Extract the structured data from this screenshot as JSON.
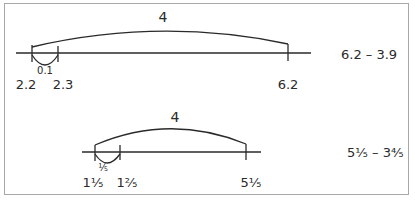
{
  "diagram_1": {
    "jump_label": "4",
    "small_jump_label": "0.1",
    "tick_labels": [
      "2.2",
      "2.3",
      "6.2"
    ],
    "expression": "6.2 – 3.9"
  },
  "diagram_2": {
    "jump_label": "4",
    "small_jump_label": "⅕",
    "tick_labels": [
      "1⅕",
      "1⅖",
      "5⅕"
    ],
    "expression": "5⅕ – 3⅘"
  },
  "colors": {
    "line": "#2a2a2a",
    "border": "#a8a8a8",
    "background": "#ffffff"
  }
}
